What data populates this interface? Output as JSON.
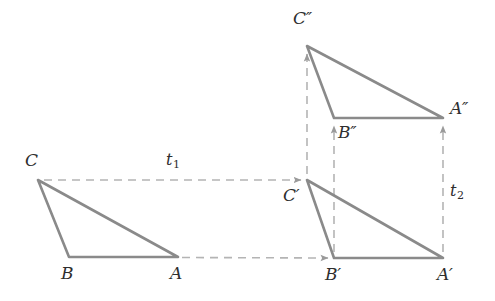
{
  "figure": {
    "background_color": "#ffffff",
    "stroke_color": "#8a8a8a",
    "dash_color": "#b0b0b0",
    "label_color": "#2e2e2e",
    "width": 495,
    "height": 301
  },
  "labels": {
    "C": "C",
    "B": "B",
    "A": "A",
    "C_prime": "C′",
    "B_prime": "B′",
    "A_prime": "A′",
    "C_double_prime": "C″",
    "B_double_prime": "B″",
    "A_double_prime": "A″",
    "t1_base": "t",
    "t1_sub": "1",
    "t2_base": "t",
    "t2_sub": "2"
  },
  "geometry": {
    "triangles": [
      {
        "name": "triangle-original",
        "vertices": {
          "C": [
            38,
            180
          ],
          "B": [
            69,
            257
          ],
          "A": [
            178,
            257
          ]
        }
      },
      {
        "name": "triangle-image-1",
        "vertices": {
          "C": [
            307,
            180
          ],
          "B": [
            334,
            258
          ],
          "A": [
            443,
            258
          ]
        }
      },
      {
        "name": "triangle-image-2",
        "vertices": {
          "C": [
            307,
            46
          ],
          "B": [
            334,
            118
          ],
          "A": [
            443,
            118
          ]
        }
      }
    ],
    "translation_arrows": [
      {
        "name": "t1-arrow-from-C",
        "from": [
          44,
          180
        ],
        "to": [
          303,
          180
        ],
        "direction": "right"
      },
      {
        "name": "t1-arrow-from-A",
        "from": [
          182,
          257
        ],
        "to": [
          330,
          258
        ],
        "direction": "right"
      },
      {
        "name": "t2-arrow-from-C-prime",
        "from": [
          307,
          174
        ],
        "to": [
          307,
          52
        ],
        "direction": "up"
      },
      {
        "name": "t2-arrow-from-B-prime",
        "from": [
          334,
          252
        ],
        "to": [
          334,
          124
        ],
        "direction": "up"
      },
      {
        "name": "t2-arrow-from-A-prime",
        "from": [
          443,
          252
        ],
        "to": [
          443,
          124
        ],
        "direction": "up"
      }
    ],
    "label_positions": {
      "C": [
        25,
        152
      ],
      "B": [
        61,
        265
      ],
      "A": [
        170,
        265
      ],
      "C_prime": [
        283,
        187
      ],
      "B_prime": [
        325,
        266
      ],
      "A_prime": [
        437,
        266
      ],
      "C_double_prime": [
        293,
        10
      ],
      "B_double_prime": [
        338,
        124
      ],
      "A_double_prime": [
        450,
        100
      ],
      "t1": [
        166,
        152
      ],
      "t2": [
        450,
        183
      ]
    }
  }
}
